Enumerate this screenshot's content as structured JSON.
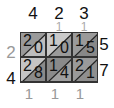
{
  "problem": {
    "multiplicand": "423",
    "multiplier": "57",
    "product": "24111"
  },
  "top_digits": [
    "4",
    "2",
    "3"
  ],
  "top_carries": [
    "",
    "1",
    "1"
  ],
  "right_digits": [
    "5",
    "7"
  ],
  "left_result": [
    "2",
    "4"
  ],
  "bottom_result": [
    "1",
    "1",
    "1"
  ],
  "cells": [
    [
      {
        "tens": "2",
        "ones": "0",
        "upper": "#9a9a9a",
        "lower": "#bdbdbd"
      },
      {
        "tens": "1",
        "ones": "0",
        "upper": "#c9c9c9",
        "lower": "#9a9a9a"
      },
      {
        "tens": "1",
        "ones": "5",
        "upper": "#9a9a9a",
        "lower": "#888888"
      }
    ],
    [
      {
        "tens": "2",
        "ones": "8",
        "upper": "#c4c4c4",
        "lower": "#8a8a8a"
      },
      {
        "tens": "1",
        "ones": "4",
        "upper": "#8a8a8a",
        "lower": "#a0a0a0"
      },
      {
        "tens": "2",
        "ones": "1",
        "upper": "#9a9a9a",
        "lower": "#8f8f8f"
      }
    ]
  ],
  "colors": {
    "border": "#333333",
    "carry": "#aaaaaa",
    "left_top_result": "#999999"
  }
}
